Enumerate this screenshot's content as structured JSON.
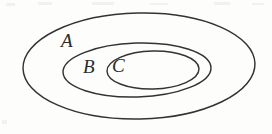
{
  "figure": {
    "kind": "nested-ellipse-set-diagram",
    "background_color": "#fdfdfc",
    "stroke_color": "#333333",
    "label_color": "#2b2b2b",
    "width": 272,
    "height": 134
  },
  "sets": [
    {
      "id": "A",
      "label": "A",
      "role": "outer-set",
      "label_x": 61,
      "label_y": 31,
      "ellipse": {
        "cx": 139,
        "cy": 66,
        "rx": 116,
        "ry": 53
      }
    },
    {
      "id": "B",
      "label": "B",
      "role": "middle-set",
      "label_x": 83,
      "label_y": 57,
      "ellipse": {
        "cx": 137,
        "cy": 70,
        "rx": 74,
        "ry": 27
      }
    },
    {
      "id": "C",
      "label": "C",
      "role": "inner-set",
      "label_x": 112,
      "label_y": 56,
      "ellipse": {
        "cx": 153,
        "cy": 70,
        "rx": 46,
        "ry": 19
      }
    }
  ],
  "relations": [
    {
      "from": "C",
      "to": "B",
      "type": "subset-of"
    },
    {
      "from": "B",
      "to": "A",
      "type": "subset-of"
    }
  ],
  "scan_artifacts": [
    {
      "x": 6,
      "y": 3,
      "w": 9,
      "h": 3
    },
    {
      "x": 38,
      "y": 2,
      "w": 14,
      "h": 3
    },
    {
      "x": 92,
      "y": 2,
      "w": 22,
      "h": 3
    },
    {
      "x": 150,
      "y": 3,
      "w": 18,
      "h": 2
    },
    {
      "x": 214,
      "y": 2,
      "w": 16,
      "h": 3
    },
    {
      "x": 252,
      "y": 3,
      "w": 12,
      "h": 2
    },
    {
      "x": 2,
      "y": 120,
      "w": 5,
      "h": 4
    }
  ]
}
